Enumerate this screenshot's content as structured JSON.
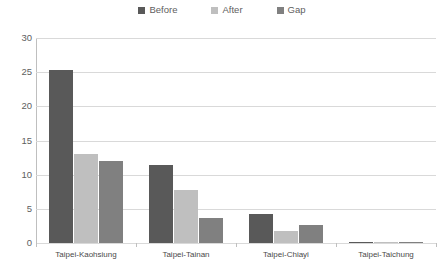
{
  "chart_data": {
    "type": "bar",
    "title": "",
    "xlabel": "",
    "ylabel": "",
    "ylim": [
      0,
      30
    ],
    "yticks": [
      30,
      25,
      20,
      15,
      10,
      5,
      0
    ],
    "grid": true,
    "legend_position": "top-center",
    "categories": [
      "Taipei-Kaohsiung",
      "Taipei-Tainan",
      "Taipei-Chiayi",
      "Taipei-Taichung"
    ],
    "series": [
      {
        "name": "Before",
        "color": "#595959",
        "values": [
          25.3,
          11.4,
          4.3,
          0.2
        ]
      },
      {
        "name": "After",
        "color": "#bfbfbf",
        "values": [
          13.0,
          7.7,
          1.8,
          0.1
        ]
      },
      {
        "name": "Gap",
        "color": "#808080",
        "values": [
          12.0,
          3.7,
          2.6,
          0.2
        ]
      }
    ]
  },
  "legend": {
    "entries": [
      {
        "label": "Before",
        "swatch": "legend-swatch-before"
      },
      {
        "label": "After",
        "swatch": "legend-swatch-after"
      },
      {
        "label": "Gap",
        "swatch": "legend-swatch-gap"
      }
    ]
  },
  "axis": {
    "y_tick_labels": [
      "30",
      "25",
      "20",
      "15",
      "10",
      "5",
      "0"
    ],
    "x_tick_labels": [
      "Taipei-Kaohsiung",
      "Taipei-Tainan",
      "Taipei-Chiayi",
      "Taipei-Taichung"
    ]
  },
  "caption": {
    "clipped_text": ""
  }
}
